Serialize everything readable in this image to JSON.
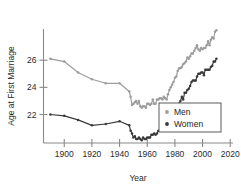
{
  "chart_data": {
    "type": "line",
    "title": "",
    "xlabel": "Year",
    "ylabel": "Age at First Marriage",
    "xlim": [
      1885,
      2022
    ],
    "ylim": [
      19.9,
      28.3
    ],
    "xticks": [
      1900,
      1920,
      1940,
      1960,
      1980,
      2000,
      2020
    ],
    "yticks": [
      22,
      24,
      26
    ],
    "grid": false,
    "legend_position": "lower-right",
    "series": [
      {
        "name": "Men",
        "color": "#9d9d9d",
        "marker": "circle",
        "points": [
          [
            1890,
            26.1
          ],
          [
            1900,
            25.9
          ],
          [
            1910,
            25.1
          ],
          [
            1920,
            24.6
          ],
          [
            1930,
            24.3
          ],
          [
            1940,
            24.3
          ],
          [
            1947,
            23.7
          ],
          [
            1948,
            23.3
          ],
          [
            1949,
            22.7
          ],
          [
            1950,
            22.8
          ],
          [
            1951,
            22.9
          ],
          [
            1952,
            23.0
          ],
          [
            1953,
            22.8
          ],
          [
            1954,
            23.0
          ],
          [
            1955,
            22.6
          ],
          [
            1956,
            22.5
          ],
          [
            1957,
            22.6
          ],
          [
            1958,
            22.6
          ],
          [
            1959,
            22.5
          ],
          [
            1960,
            22.8
          ],
          [
            1961,
            22.8
          ],
          [
            1962,
            22.7
          ],
          [
            1963,
            22.8
          ],
          [
            1964,
            23.1
          ],
          [
            1965,
            22.8
          ],
          [
            1966,
            22.8
          ],
          [
            1967,
            23.1
          ],
          [
            1968,
            23.1
          ],
          [
            1969,
            23.2
          ],
          [
            1970,
            23.2
          ],
          [
            1971,
            23.1
          ],
          [
            1972,
            23.3
          ],
          [
            1973,
            23.2
          ],
          [
            1974,
            23.1
          ],
          [
            1975,
            23.5
          ],
          [
            1976,
            23.8
          ],
          [
            1977,
            24.0
          ],
          [
            1978,
            24.2
          ],
          [
            1979,
            24.4
          ],
          [
            1980,
            24.7
          ],
          [
            1981,
            24.8
          ],
          [
            1982,
            25.2
          ],
          [
            1983,
            25.4
          ],
          [
            1984,
            25.4
          ],
          [
            1985,
            25.5
          ],
          [
            1986,
            25.7
          ],
          [
            1987,
            25.8
          ],
          [
            1988,
            25.9
          ],
          [
            1989,
            26.2
          ],
          [
            1990,
            26.1
          ],
          [
            1991,
            26.3
          ],
          [
            1992,
            26.5
          ],
          [
            1993,
            26.5
          ],
          [
            1994,
            26.7
          ],
          [
            1995,
            26.9
          ],
          [
            1996,
            27.1
          ],
          [
            1997,
            26.8
          ],
          [
            1998,
            26.7
          ],
          [
            1999,
            26.9
          ],
          [
            2000,
            26.8
          ],
          [
            2001,
            26.9
          ],
          [
            2002,
            26.9
          ],
          [
            2003,
            27.1
          ],
          [
            2004,
            27.4
          ],
          [
            2005,
            27.1
          ],
          [
            2006,
            27.5
          ],
          [
            2007,
            27.7
          ],
          [
            2008,
            27.6
          ],
          [
            2009,
            28.1
          ],
          [
            2010,
            28.2
          ]
        ]
      },
      {
        "name": "Women",
        "color": "#3a3a3a",
        "marker": "circle",
        "points": [
          [
            1890,
            22.0
          ],
          [
            1900,
            21.9
          ],
          [
            1910,
            21.6
          ],
          [
            1920,
            21.2
          ],
          [
            1930,
            21.3
          ],
          [
            1940,
            21.5
          ],
          [
            1947,
            21.2
          ],
          [
            1948,
            20.8
          ],
          [
            1949,
            20.6
          ],
          [
            1950,
            20.3
          ],
          [
            1951,
            20.4
          ],
          [
            1952,
            20.2
          ],
          [
            1953,
            20.2
          ],
          [
            1954,
            20.3
          ],
          [
            1955,
            20.2
          ],
          [
            1956,
            20.1
          ],
          [
            1957,
            20.3
          ],
          [
            1958,
            20.2
          ],
          [
            1959,
            20.2
          ],
          [
            1960,
            20.3
          ],
          [
            1961,
            20.3
          ],
          [
            1962,
            20.3
          ],
          [
            1963,
            20.5
          ],
          [
            1964,
            20.5
          ],
          [
            1965,
            20.6
          ],
          [
            1966,
            20.5
          ],
          [
            1967,
            20.6
          ],
          [
            1968,
            20.8
          ],
          [
            1969,
            20.8
          ],
          [
            1970,
            20.8
          ],
          [
            1971,
            20.9
          ],
          [
            1972,
            20.9
          ],
          [
            1973,
            21.0
          ],
          [
            1974,
            21.1
          ],
          [
            1975,
            21.1
          ],
          [
            1976,
            21.3
          ],
          [
            1977,
            21.6
          ],
          [
            1978,
            21.8
          ],
          [
            1979,
            22.1
          ],
          [
            1980,
            22.0
          ],
          [
            1981,
            22.3
          ],
          [
            1982,
            22.5
          ],
          [
            1983,
            22.8
          ],
          [
            1984,
            23.0
          ],
          [
            1985,
            23.3
          ],
          [
            1986,
            23.1
          ],
          [
            1987,
            23.6
          ],
          [
            1988,
            23.6
          ],
          [
            1989,
            23.8
          ],
          [
            1990,
            23.9
          ],
          [
            1991,
            24.1
          ],
          [
            1992,
            24.4
          ],
          [
            1993,
            24.5
          ],
          [
            1994,
            24.5
          ],
          [
            1995,
            24.5
          ],
          [
            1996,
            24.8
          ],
          [
            1997,
            25.0
          ],
          [
            1998,
            25.0
          ],
          [
            1999,
            25.1
          ],
          [
            2000,
            25.1
          ],
          [
            2001,
            24.9
          ],
          [
            2002,
            25.3
          ],
          [
            2003,
            25.3
          ],
          [
            2004,
            25.3
          ],
          [
            2005,
            25.3
          ],
          [
            2006,
            25.5
          ],
          [
            2007,
            25.6
          ],
          [
            2008,
            25.9
          ],
          [
            2009,
            25.9
          ],
          [
            2010,
            26.1
          ]
        ]
      }
    ],
    "legend": [
      {
        "label": "Men",
        "color": "#9d9d9d"
      },
      {
        "label": "Women",
        "color": "#3a3a3a"
      }
    ]
  }
}
